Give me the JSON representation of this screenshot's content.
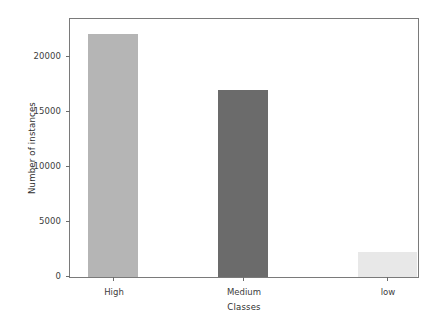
{
  "chart_data": {
    "type": "bar",
    "title": "",
    "xlabel": "Classes",
    "ylabel": "Number of instances",
    "categories": [
      "High",
      "Medium",
      "low"
    ],
    "values": [
      22000,
      17000,
      2250
    ],
    "series": [
      {
        "name": "Number of instances",
        "values": [
          22000,
          17000,
          2250
        ]
      }
    ],
    "bar_colors": [
      "#b5b5b5",
      "#6b6b6b",
      "#e8e8e8"
    ],
    "ylim": [
      0,
      23400
    ],
    "xlim": [
      0,
      3
    ],
    "yticks": [
      0,
      5000,
      10000,
      15000,
      20000
    ],
    "ytick_labels": [
      "0",
      "5000",
      "10000",
      "15000",
      "20000"
    ],
    "xtick_labels": [
      "High",
      "Medium",
      "low"
    ],
    "grid": false,
    "legend": null,
    "legend_position": "none",
    "frame": true
  },
  "colors": {
    "axis": "#7a7a7a",
    "tick": "#6d6d6d",
    "text": "#3d3d3d",
    "label": "#2e2e2e",
    "background": "#ffffff"
  }
}
